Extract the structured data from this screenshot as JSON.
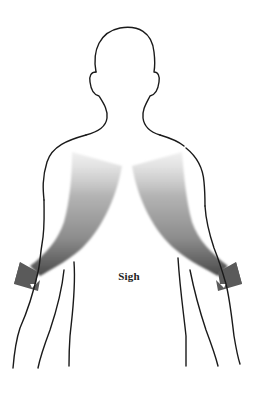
{
  "figure": {
    "label": "Sigh",
    "colors": {
      "background": "#ffffff",
      "outline": "#1a1a1a",
      "arrow_light": "#e6e6e6",
      "arrow_mid": "#a8a8a8",
      "arrow_dark": "#4f4f4f",
      "arrowhead": "#5a5a5a"
    },
    "arrows": [
      {
        "side": "left",
        "direction": "down-and-outward"
      },
      {
        "side": "right",
        "direction": "down-and-outward"
      }
    ]
  }
}
